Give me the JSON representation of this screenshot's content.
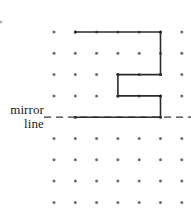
{
  "figure": {
    "label": {
      "line1": "mirror",
      "line2": "line"
    },
    "colors": {
      "shape_stroke": "#2b2b2b",
      "mirror_line": "#3a3a3a",
      "dot": "#6b6b78",
      "background": "#ffffff",
      "text": "#1c1c1c"
    },
    "grid": {
      "spacing": 21.3,
      "origin_x": 54,
      "origin_y": 32,
      "columns": 7,
      "rows_above_mirror": 5,
      "rows_below_mirror": 4,
      "dot_radius": 1.5,
      "dots_x": [
        54,
        75.3,
        96.6,
        117.9,
        139.2,
        160.5,
        181.8
      ],
      "dots_y_above": [
        32,
        53.3,
        74.6,
        95.9
      ],
      "dots_y_mirror": 117.2,
      "dots_y_below": [
        138.5,
        159.8,
        181.1,
        202.4
      ],
      "extra_dot": {
        "x": 1,
        "y": 22
      }
    },
    "mirror_line": {
      "y": 117.2,
      "x_start": 44,
      "x_end": 191,
      "dash": "7 5",
      "width": 1.3
    },
    "shape": {
      "name": "C-shaped-polygon",
      "stroke_width": 1.6,
      "points": "75.3,32 160.5,32 160.5,74.6 117.9,74.6 117.9,95.9 160.5,95.9 160.5,117.2 75.3,117.2",
      "vertices": [
        {
          "x": 75.3,
          "y": 32
        },
        {
          "x": 160.5,
          "y": 32
        },
        {
          "x": 160.5,
          "y": 74.6
        },
        {
          "x": 117.9,
          "y": 74.6
        },
        {
          "x": 117.9,
          "y": 95.9
        },
        {
          "x": 160.5,
          "y": 95.9
        },
        {
          "x": 160.5,
          "y": 117.2
        },
        {
          "x": 75.3,
          "y": 117.2
        }
      ]
    }
  }
}
